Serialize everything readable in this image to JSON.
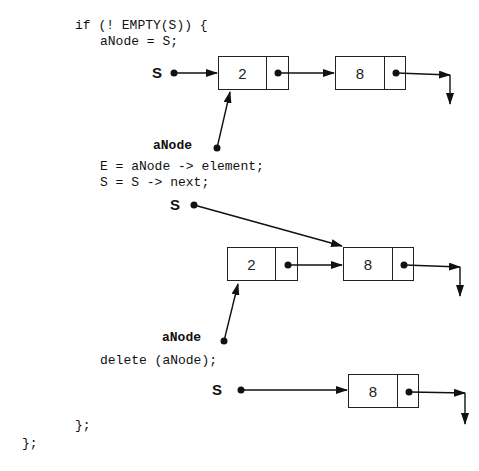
{
  "code": {
    "line_if": "if (! EMPTY(S)) {",
    "line_assign": "aNode = S;",
    "line_element": "E = aNode -> element;",
    "line_next": "S = S -> next;",
    "line_delete": "delete (aNode);",
    "line_close_inner": "};",
    "line_close_outer": "};"
  },
  "labels": {
    "s_pointer": "S",
    "anode_pointer": "aNode"
  },
  "stage1": {
    "nodes": [
      {
        "value": "2"
      },
      {
        "value": "8"
      }
    ]
  },
  "stage2": {
    "nodes": [
      {
        "value": "2"
      },
      {
        "value": "8"
      }
    ]
  },
  "stage3": {
    "nodes": [
      {
        "value": "8"
      }
    ]
  },
  "colors": {
    "line": "#111111",
    "background": "#ffffff"
  }
}
